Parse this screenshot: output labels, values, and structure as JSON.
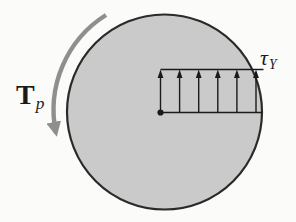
{
  "figure": {
    "background": "#fbfbf9",
    "circle_fill": "#cacaca",
    "circle_stroke": "#2b2a28",
    "torque_arrow_color": "#8f8f8f",
    "stress_color": "#1a1a1a"
  },
  "labels": {
    "torque": {
      "main": "T",
      "sub": "p"
    },
    "shear_stress": {
      "main": "τ",
      "sub": "Y"
    }
  }
}
